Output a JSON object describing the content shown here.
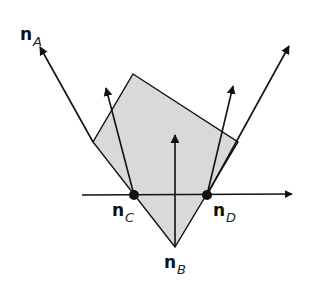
{
  "colors": {
    "polygon_fill": "#d9d9d9",
    "stroke": "#111111",
    "background": "#ffffff"
  },
  "labels": {
    "nA": {
      "main": "n",
      "sub": "A"
    },
    "nB": {
      "main": "n",
      "sub": "B"
    },
    "nC": {
      "main": "n",
      "sub": "C"
    },
    "nD": {
      "main": "n",
      "sub": "D"
    }
  },
  "points": {
    "C": [
      134,
      195
    ],
    "D": [
      207,
      195
    ],
    "B_vertex": [
      175,
      247
    ]
  }
}
